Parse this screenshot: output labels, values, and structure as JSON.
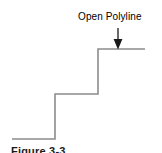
{
  "figure": {
    "background_color": "#ffffff",
    "annotation": {
      "label": "Open Polyline",
      "arrow_name": "down-arrow-icon",
      "arrow_color": "#1a1a1a"
    },
    "caption": "Figure 3-3",
    "polyline": {
      "name": "open-polyline",
      "stroke_color": "#8c8c8c",
      "stroke_width": 1.6,
      "closed": false,
      "points": [
        [
          12,
          139
        ],
        [
          55,
          139
        ],
        [
          55,
          94
        ],
        [
          98,
          94
        ],
        [
          98,
          49
        ],
        [
          145,
          49
        ]
      ]
    }
  },
  "chart_data": {
    "type": "line",
    "title": "Open Polyline",
    "xlabel": "",
    "ylabel": "",
    "x": [
      12,
      55,
      55,
      98,
      98,
      145
    ],
    "values": [
      139,
      139,
      94,
      94,
      49,
      49
    ],
    "series": [
      {
        "name": "Open Polyline",
        "values": [
          139,
          139,
          94,
          94,
          49,
          49
        ]
      }
    ],
    "xlim": [
      0,
      162
    ],
    "ylim": [
      153,
      0
    ],
    "grid": false,
    "legend": "none",
    "annotations": [
      {
        "text": "Open Polyline",
        "arrow": "down",
        "target_x": 118,
        "target_y": 49
      }
    ]
  }
}
